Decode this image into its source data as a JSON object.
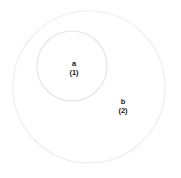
{
  "diagram": {
    "type": "nested-venn",
    "background_color": "#ffffff",
    "stroke_color": "#e6e6e6",
    "label_color": "#1a1a1a",
    "sets": [
      {
        "id": "a",
        "label": "a",
        "count_label": "(1)",
        "count": 1,
        "cx": 72,
        "cy": 66,
        "r": 35,
        "stroke": "#e4e4e4",
        "stroke_width": 1.1,
        "nested_in": "b"
      },
      {
        "id": "b",
        "label": "b",
        "count_label": "(2)",
        "count": 2,
        "cx": 89,
        "cy": 87,
        "r": 76,
        "stroke": "#ededed",
        "stroke_width": 1.1,
        "nested_in": null
      }
    ]
  }
}
